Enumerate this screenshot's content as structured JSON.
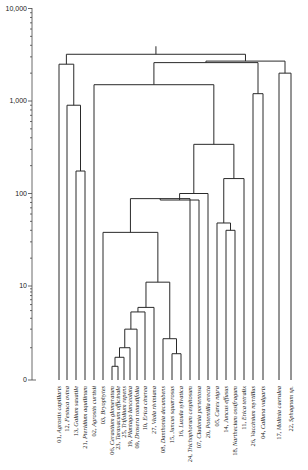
{
  "chart_data": {
    "type": "dendrogram",
    "title": "",
    "ylabel": "",
    "yscale": "log",
    "yticks": [
      {
        "label": "10,000",
        "value": 10000
      },
      {
        "label": "1,000",
        "value": 1000
      },
      {
        "label": "100",
        "value": 100
      },
      {
        "label": "10",
        "value": 10
      },
      {
        "label": "0",
        "value": 0
      }
    ],
    "leaves": [
      {
        "id": "01",
        "name": "Agrostis capillaris"
      },
      {
        "id": "12",
        "name": "Festuca ovina"
      },
      {
        "id": "13",
        "name": "Galium saxatile"
      },
      {
        "id": "21",
        "name": "Pteridium aquilinum"
      },
      {
        "id": "02",
        "name": "Agrostis curtisii"
      },
      {
        "id": "03",
        "name": "Bryophytes"
      },
      {
        "id": "06",
        "name": "Cerastium glomeratum"
      },
      {
        "id": "23",
        "name": "Taraxacum officinale"
      },
      {
        "id": "25",
        "name": "Trifolium repens"
      },
      {
        "id": "19",
        "name": "Plantago lanceolata"
      },
      {
        "id": "09",
        "name": "Drosera rotundifolia"
      },
      {
        "id": "10",
        "name": "Erica cinerea"
      },
      {
        "id": "27",
        "name": "Viola riviniana"
      },
      {
        "id": "08",
        "name": "Danthonia decumbens"
      },
      {
        "id": "15",
        "name": "Juncus squarrosus"
      },
      {
        "id": "16",
        "name": "Luzula sylvatica"
      },
      {
        "id": "24",
        "name": "Trichophorum cespitosum"
      },
      {
        "id": "07",
        "name": "Cladonia portentosa"
      },
      {
        "id": "20",
        "name": "Potentilla erecta"
      },
      {
        "id": "05",
        "name": "Carex nigra"
      },
      {
        "id": "14",
        "name": "Juncus effusus"
      },
      {
        "id": "18",
        "name": "Narthecium ossifragum"
      },
      {
        "id": "11",
        "name": "Erica tetralix"
      },
      {
        "id": "26",
        "name": "Vaccinium myrtillus"
      },
      {
        "id": "04",
        "name": "Calluna vulgaris"
      },
      {
        "id": "17",
        "name": "Molinia caerulea"
      },
      {
        "id": "22",
        "name": "Sphagnum sp."
      }
    ],
    "merges": [
      {
        "left": "06",
        "right": "23",
        "height": 0.5
      },
      {
        "left": "06+23",
        "right": "25",
        "height": 0.7
      },
      {
        "left": "06+23+25",
        "right": "19",
        "height": 1.0
      },
      {
        "left": "06..19",
        "right": "09",
        "height": 2.0
      },
      {
        "left": "15",
        "right": "16",
        "height": 0.8
      },
      {
        "left": "08",
        "right": "15+16",
        "height": 1.4
      },
      {
        "left": "06..09",
        "right": "10",
        "height": 3.8
      },
      {
        "left": "06..10",
        "right": "27",
        "height": 4.5
      },
      {
        "left": "06..27",
        "right": "08..16",
        "height": 11
      },
      {
        "left": "03",
        "right": "06..16",
        "height": 38
      },
      {
        "left": "03..16",
        "right": "24",
        "height": 88
      },
      {
        "left": "14",
        "right": "18",
        "height": 40
      },
      {
        "left": "05",
        "right": "14+18",
        "height": 48
      },
      {
        "left": "03..24",
        "right": "07",
        "height": 85
      },
      {
        "left": "05..18",
        "right": "11",
        "height": 145
      },
      {
        "left": "03..07",
        "right": "20",
        "height": 100
      },
      {
        "left": "03..20",
        "right": "05..11",
        "height": 340
      },
      {
        "left": "13",
        "right": "21",
        "height": 175
      },
      {
        "left": "12",
        "right": "13+21",
        "height": 900
      },
      {
        "left": "01",
        "right": "12..21",
        "height": 2500
      },
      {
        "left": "02",
        "right": "03..11",
        "height": 1500
      },
      {
        "left": "26",
        "right": "04",
        "height": 1200
      },
      {
        "left": "02..11",
        "right": "26+04",
        "height": 2600
      },
      {
        "left": "17",
        "right": "22",
        "height": 2000
      },
      {
        "left": "02..04",
        "right": "17+22",
        "height": 2700
      },
      {
        "left": "01..21",
        "right": "02..22",
        "height": 3200
      }
    ]
  },
  "caption": ""
}
